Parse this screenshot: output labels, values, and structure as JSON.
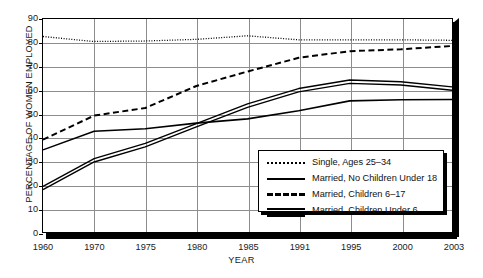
{
  "chart_data": {
    "type": "line",
    "title": "",
    "xlabel": "YEAR",
    "ylabel": "PERCENTAGE OF WOMEN EMPLOYED",
    "x": [
      1960,
      1970,
      1975,
      1980,
      1985,
      1991,
      1995,
      2000,
      2003
    ],
    "xtick_labels": [
      "1960",
      "1970",
      "1975",
      "1980",
      "1985",
      "1991",
      "1995",
      "2000",
      "2003"
    ],
    "ytick_labels": [
      "0",
      "10",
      "20",
      "30",
      "40",
      "50",
      "60",
      "70",
      "80",
      "90"
    ],
    "yticks": [
      0,
      10,
      20,
      30,
      40,
      50,
      60,
      70,
      80,
      90
    ],
    "ylim": [
      0,
      90
    ],
    "grid": "both",
    "legend_position": "inside-lower-right",
    "series": [
      {
        "name": "Single, Ages 25–34",
        "style": "dotted",
        "values": [
          82.6,
          80.5,
          80.7,
          81.4,
          82.9,
          81.2,
          81.2,
          81.2,
          81.0
        ]
      },
      {
        "name": "Married, No Children Under 18",
        "style": "solid",
        "values": [
          34.7,
          42.6,
          43.6,
          46.0,
          47.8,
          51.2,
          55.4,
          55.9,
          56.0
        ]
      },
      {
        "name": "Married, Children 6–17",
        "style": "dashed",
        "values": [
          39.0,
          49.2,
          52.4,
          61.7,
          67.8,
          73.6,
          76.4,
          77.2,
          78.6
        ]
      },
      {
        "name": "Married, Children Under 6",
        "style": "double",
        "values": [
          18.6,
          30.3,
          36.7,
          45.1,
          53.4,
          59.9,
          63.5,
          62.8,
          60.6
        ]
      }
    ]
  },
  "colors": {
    "ink": "#000000",
    "grid": "#8d8d8d",
    "background": "#ffffff"
  }
}
